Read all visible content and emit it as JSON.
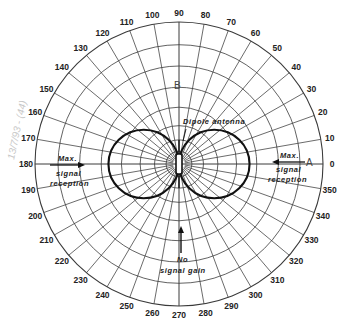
{
  "chart_data": {
    "type": "polar",
    "title": "",
    "subtitle": "Dipole antenna radiation pattern (figure-eight)",
    "angle_unit": "degrees",
    "angle_ticks": [
      0,
      10,
      20,
      30,
      40,
      50,
      60,
      70,
      80,
      90,
      100,
      110,
      120,
      130,
      140,
      150,
      160,
      170,
      180,
      190,
      200,
      210,
      220,
      230,
      240,
      250,
      260,
      270,
      280,
      290,
      300,
      310,
      320,
      330,
      340,
      350
    ],
    "angle_tick_labels": [
      "0",
      "10",
      "20",
      "30",
      "40",
      "50",
      "60",
      "70",
      "80",
      "90",
      "100",
      "110",
      "120",
      "130",
      "140",
      "150",
      "160",
      "170",
      "180",
      "190",
      "200",
      "210",
      "220",
      "230",
      "240",
      "250",
      "260",
      "270",
      "280",
      "290",
      "300",
      "310",
      "320",
      "330",
      "340",
      "350"
    ],
    "radial_rings": 7,
    "grid": true,
    "series": [
      {
        "name": "Dipole antenna pattern",
        "shape": "figure-eight (two circular lobes)",
        "lobes": [
          {
            "direction_deg": 0,
            "relative_extent": 0.49
          },
          {
            "direction_deg": 180,
            "relative_extent": 0.49
          }
        ],
        "nulls_deg": [
          90,
          270
        ]
      }
    ],
    "annotations": [
      {
        "text": "Dipole antenna",
        "near_deg": 60
      },
      {
        "text": "Max. signal reception",
        "direction_deg": 0,
        "arrow": "inward"
      },
      {
        "text": "Max. signal reception",
        "direction_deg": 180,
        "arrow": "inward"
      },
      {
        "text": "No signal gain",
        "direction_deg": 270,
        "arrow": "inward"
      },
      {
        "text": "A",
        "position_deg": 0
      },
      {
        "text": "B",
        "position_deg": 90
      }
    ]
  },
  "labels": {
    "dipole": "Dipole antenna",
    "max_right_1": "Max.",
    "max_right_2": "signal",
    "max_right_3": "reception",
    "max_left_1": "Max.",
    "max_left_2": "signal",
    "max_left_3": "reception",
    "no_gain_1": "No",
    "no_gain_2": "signal gain",
    "point_a": "A",
    "point_b": "B",
    "handwritten": "13/7/93 - (44)"
  },
  "colors": {
    "grid": "#3a3a3a",
    "pattern": "#111111",
    "text": "#222222",
    "background": "#ffffff"
  }
}
